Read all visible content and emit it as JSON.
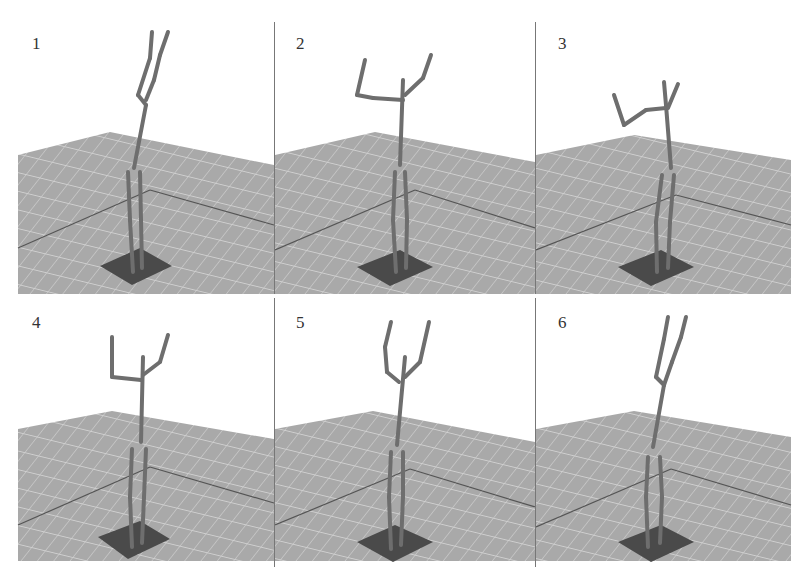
{
  "figure": {
    "layout": "2x3 grid",
    "panels": [
      {
        "label": "1",
        "pose": "both arms raised straight up"
      },
      {
        "label": "2",
        "pose": "left arm bent horizontal, right arm raised"
      },
      {
        "label": "3",
        "pose": "left arm extended out and bent down-up, right arm raised"
      },
      {
        "label": "4",
        "pose": "both arms bent at elbows, forearms up"
      },
      {
        "label": "5",
        "pose": "arms curved upward forming a V"
      },
      {
        "label": "6",
        "pose": "both arms raised straight up"
      }
    ],
    "colors": {
      "background": "#ffffff",
      "floor": "#a9a9a9",
      "floor_grid": "#cfcfcf",
      "floor_line": "#555555",
      "platform": "#4a4a4a",
      "figure": "#6e6e6e",
      "separator": "#777777"
    }
  }
}
